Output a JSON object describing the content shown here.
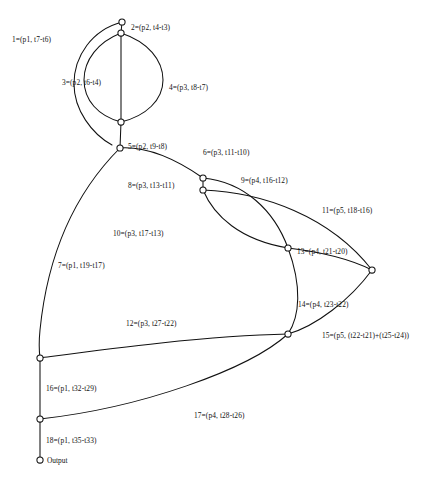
{
  "figure": {
    "caption": "",
    "background_color": "#ffffff",
    "stroke_color": "#111111"
  },
  "nodes": [
    {
      "id": "n1",
      "name": "node-top",
      "x": 122,
      "y": 22,
      "r": 3.1,
      "label": ""
    },
    {
      "id": "n2",
      "name": "node-upper",
      "x": 121,
      "y": 33,
      "r": 3.1,
      "label": ""
    },
    {
      "id": "n3",
      "name": "node-mid-upper",
      "x": 121,
      "y": 122,
      "r": 3.1,
      "label": ""
    },
    {
      "id": "n4",
      "name": "node-mid",
      "x": 120,
      "y": 148,
      "r": 3.1,
      "label": ""
    },
    {
      "id": "n5",
      "name": "node-center-upper",
      "x": 203,
      "y": 178,
      "r": 3.1,
      "label": ""
    },
    {
      "id": "n6",
      "name": "node-center-lower",
      "x": 203,
      "y": 190,
      "r": 3.1,
      "label": ""
    },
    {
      "id": "n7",
      "name": "node-right-mid",
      "x": 288,
      "y": 248,
      "r": 3.1,
      "label": ""
    },
    {
      "id": "n8",
      "name": "node-far-right",
      "x": 372,
      "y": 270,
      "r": 3.1,
      "label": ""
    },
    {
      "id": "n9",
      "name": "node-right-lower",
      "x": 288,
      "y": 334,
      "r": 3.1,
      "label": ""
    },
    {
      "id": "n10",
      "name": "node-left-lower",
      "x": 40,
      "y": 358,
      "r": 3.1,
      "label": ""
    },
    {
      "id": "n11",
      "name": "node-left-bottom",
      "x": 40,
      "y": 419,
      "r": 3.1,
      "label": ""
    },
    {
      "id": "n12",
      "name": "node-output",
      "x": 40,
      "y": 460,
      "r": 3.1,
      "label": "Output"
    }
  ],
  "edges": [
    {
      "id": 1,
      "name": "edge-1",
      "label": "1=(p1, t7-t6)",
      "label_x": 12,
      "label_y": 36,
      "path": "M122,22 C92,30 74,56 74,84 C74,110 92,134 112,145"
    },
    {
      "id": 2,
      "name": "edge-2",
      "label": "2=(p2, t4-t3)",
      "label_x": 131,
      "label_y": 24,
      "path": "M122,22 L121,33"
    },
    {
      "id": 3,
      "name": "edge-3",
      "label": "3=(p2, t6-t4)",
      "label_x": 62,
      "label_y": 79,
      "path": "M121,33 C98,42 84,60 84,80 C84,100 98,116 121,122"
    },
    {
      "id": 4,
      "name": "edge-4",
      "label": "4=(p3, t8-t7)",
      "label_x": 169,
      "label_y": 84,
      "path": "M121,33 C148,42 163,60 163,80 C163,100 146,116 121,122"
    },
    {
      "id": 5,
      "name": "edge-5",
      "label": "5=(p2, t9-t8)",
      "label_x": 128,
      "label_y": 143,
      "path": "M121,33 L121,122 L120,148"
    },
    {
      "id": 6,
      "name": "edge-6",
      "label": "6=(p3, t11-t10)",
      "label_x": 203,
      "label_y": 149,
      "path": "M120,148 C150,146 180,162 203,178"
    },
    {
      "id": 7,
      "name": "edge-7",
      "label": "7=(p1, t19-t17)",
      "label_x": 58,
      "label_y": 262,
      "path": "M120,148 C78,190 48,250 40,330 C39,340 39,350 40,358"
    },
    {
      "id": 8,
      "name": "edge-8",
      "label": "8=(p3, t13-t11)",
      "label_x": 128,
      "label_y": 182,
      "path": "M203,178 L203,190"
    },
    {
      "id": 9,
      "name": "edge-9",
      "label": "9=(p4, t16-t12)",
      "label_x": 241,
      "label_y": 177,
      "path": "M203,178 C244,182 274,210 288,248"
    },
    {
      "id": 10,
      "name": "edge-10",
      "label": "10=(p3, t17-t13)",
      "label_x": 113,
      "label_y": 230,
      "path": "M203,190 C214,216 240,240 288,248"
    },
    {
      "id": 11,
      "name": "edge-11",
      "label": "11=(p5, t18-t16)",
      "label_x": 322,
      "label_y": 207,
      "path": "M203,190 C262,192 330,216 372,270"
    },
    {
      "id": 12,
      "name": "edge-12",
      "label": "12=(p3, t27-t22)",
      "label_x": 126,
      "label_y": 320,
      "path": "M288,334 C200,336 100,350 40,358"
    },
    {
      "id": 13,
      "name": "edge-13",
      "label": "13=(p4, t21-t20)",
      "label_x": 297,
      "label_y": 248,
      "path": "M288,248 C322,252 352,260 372,270"
    },
    {
      "id": 14,
      "name": "edge-14",
      "label": "14=(p4, t23-t22)",
      "label_x": 298,
      "label_y": 301,
      "path": "M288,248 C302,286 300,316 288,334"
    },
    {
      "id": 15,
      "name": "edge-15",
      "label": "15=(p5, (t22-t21)+(t25-t24))",
      "label_x": 322,
      "label_y": 332,
      "path": "M372,270 C350,300 316,326 288,334"
    },
    {
      "id": 16,
      "name": "edge-16",
      "label": "16=(p1, t32-t29)",
      "label_x": 46,
      "label_y": 385,
      "path": "M40,358 L40,419"
    },
    {
      "id": 17,
      "name": "edge-17",
      "label": "17=(p4, t28-t26)",
      "label_x": 194,
      "label_y": 412,
      "path": "M288,334 C248,370 140,408 40,419"
    },
    {
      "id": 18,
      "name": "edge-18",
      "label": "18=(p1, t35-t33)",
      "label_x": 46,
      "label_y": 437,
      "path": "M40,419 L40,460"
    }
  ]
}
